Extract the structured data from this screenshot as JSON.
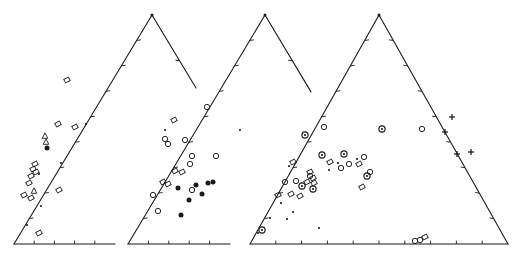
{
  "figure": {
    "background": "#ffffff",
    "line_color": "#1a1a1a",
    "marker_color": "#1a1a1a"
  },
  "panels": [
    {
      "id": "a",
      "label": "a)",
      "label_x": 104,
      "label_y": 24,
      "apex_label": "Na",
      "apex_label_x": 159,
      "apex_label_y": 18,
      "left_label": "Ca",
      "left_label_x": 9,
      "left_label_y": 259,
      "right_label": "",
      "geometry": {
        "apex": [
          152,
          15
        ],
        "left": [
          14,
          244
        ],
        "right": [
          290,
          244
        ],
        "clip_right_x": 196,
        "truncated": true
      },
      "ticks_left": 8,
      "ticks_right": 4,
      "ticks_bottom": 4
    },
    {
      "id": "b",
      "label": "b)",
      "label_x": 220,
      "label_y": 24,
      "apex_label": "Na",
      "apex_label_x": 272,
      "apex_label_y": 18,
      "left_label": "Ca",
      "left_label_x": 124,
      "left_label_y": 259,
      "right_label": "",
      "geometry": {
        "apex": [
          265,
          15
        ],
        "left": [
          128,
          244
        ],
        "right": [
          402,
          244
        ],
        "clip_right_x": 311,
        "truncated": true
      },
      "ticks_left": 8,
      "ticks_right": 4,
      "ticks_bottom": 4
    },
    {
      "id": "c",
      "label": "c)",
      "label_x": 337,
      "label_y": 24,
      "apex_label": "Na",
      "apex_label_x": 385,
      "apex_label_y": 18,
      "left_label": "Ca",
      "left_label_x": 247,
      "left_label_y": 259,
      "right_label": "K",
      "right_label_x": 502,
      "right_label_y": 259,
      "geometry": {
        "apex": [
          379,
          15
        ],
        "left": [
          250,
          244
        ],
        "right": [
          508,
          244
        ],
        "clip_right_x": 522,
        "truncated": false
      },
      "ticks_left": 8,
      "ticks_right": 8,
      "ticks_bottom": 9
    }
  ],
  "chart_data": {
    "type": "scatter",
    "xlabel": "Ca - K",
    "ylabel": "Na",
    "vertices": [
      "Ca",
      "Na",
      "K"
    ],
    "marker_legend": {
      "slanted-square": "open slanted square",
      "triangle": "open triangle",
      "filled-circle": "filled circle",
      "open-circle": "open circle",
      "bullseye": "circle with center dot",
      "plus": "plus sign",
      "dot": "small dot"
    },
    "series": [
      {
        "panel": "a",
        "name": "panel-a-points",
        "points": [
          {
            "x": 67,
            "y": 80,
            "m": "slanted-square"
          },
          {
            "x": 58,
            "y": 124,
            "m": "slanted-square"
          },
          {
            "x": 75,
            "y": 127,
            "m": "slanted-square"
          },
          {
            "x": 45,
            "y": 136,
            "m": "triangle"
          },
          {
            "x": 46,
            "y": 142,
            "m": "triangle"
          },
          {
            "x": 47,
            "y": 148,
            "m": "filled-circle"
          },
          {
            "x": 35,
            "y": 164,
            "m": "slanted-square"
          },
          {
            "x": 33,
            "y": 169,
            "m": "slanted-square"
          },
          {
            "x": 36,
            "y": 172,
            "m": "slanted-square"
          },
          {
            "x": 31,
            "y": 176,
            "m": "slanted-square"
          },
          {
            "x": 39,
            "y": 174,
            "m": "dot"
          },
          {
            "x": 29,
            "y": 183,
            "m": "slanted-square"
          },
          {
            "x": 34,
            "y": 191,
            "m": "triangle"
          },
          {
            "x": 24,
            "y": 195,
            "m": "slanted-square"
          },
          {
            "x": 31,
            "y": 198,
            "m": "slanted-square"
          },
          {
            "x": 59,
            "y": 190,
            "m": "slanted-square"
          },
          {
            "x": 86,
            "y": 124,
            "m": "dot"
          },
          {
            "x": 61,
            "y": 163,
            "m": "dot"
          },
          {
            "x": 41,
            "y": 206,
            "m": "dot"
          },
          {
            "x": 27,
            "y": 225,
            "m": "dot"
          },
          {
            "x": 39,
            "y": 233,
            "m": "slanted-square"
          },
          {
            "x": 165,
            "y": 130,
            "m": "dot"
          }
        ]
      },
      {
        "panel": "b",
        "name": "panel-b-points",
        "points": [
          {
            "x": 174,
            "y": 120,
            "m": "slanted-square"
          },
          {
            "x": 207,
            "y": 107,
            "m": "open-circle"
          },
          {
            "x": 165,
            "y": 139,
            "m": "open-circle"
          },
          {
            "x": 168,
            "y": 144,
            "m": "open-circle"
          },
          {
            "x": 185,
            "y": 140,
            "m": "open-circle"
          },
          {
            "x": 216,
            "y": 156,
            "m": "open-circle"
          },
          {
            "x": 192,
            "y": 156,
            "m": "open-circle"
          },
          {
            "x": 190,
            "y": 164,
            "m": "open-circle"
          },
          {
            "x": 175,
            "y": 171,
            "m": "slanted-square"
          },
          {
            "x": 182,
            "y": 172,
            "m": "slanted-square"
          },
          {
            "x": 163,
            "y": 182,
            "m": "slanted-square"
          },
          {
            "x": 168,
            "y": 184,
            "m": "slanted-square"
          },
          {
            "x": 178,
            "y": 188,
            "m": "filled-circle"
          },
          {
            "x": 196,
            "y": 185,
            "m": "filled-circle"
          },
          {
            "x": 208,
            "y": 183,
            "m": "filled-circle"
          },
          {
            "x": 213,
            "y": 182,
            "m": "filled-circle"
          },
          {
            "x": 192,
            "y": 190,
            "m": "open-circle"
          },
          {
            "x": 202,
            "y": 194,
            "m": "filled-circle"
          },
          {
            "x": 153,
            "y": 195,
            "m": "open-circle"
          },
          {
            "x": 158,
            "y": 211,
            "m": "open-circle"
          },
          {
            "x": 189,
            "y": 200,
            "m": "filled-circle"
          },
          {
            "x": 181,
            "y": 215,
            "m": "filled-circle"
          },
          {
            "x": 240,
            "y": 130,
            "m": "dot"
          }
        ]
      },
      {
        "panel": "c",
        "name": "panel-c-points",
        "points": [
          {
            "x": 382,
            "y": 129,
            "m": "bullseye"
          },
          {
            "x": 305,
            "y": 135,
            "m": "bullseye"
          },
          {
            "x": 324,
            "y": 127,
            "m": "open-circle"
          },
          {
            "x": 422,
            "y": 129,
            "m": "open-circle"
          },
          {
            "x": 445,
            "y": 132,
            "m": "plus"
          },
          {
            "x": 452,
            "y": 117,
            "m": "plus"
          },
          {
            "x": 471,
            "y": 152,
            "m": "plus"
          },
          {
            "x": 457,
            "y": 154,
            "m": "plus"
          },
          {
            "x": 322,
            "y": 155,
            "m": "bullseye"
          },
          {
            "x": 344,
            "y": 154,
            "m": "bullseye"
          },
          {
            "x": 364,
            "y": 157,
            "m": "open-circle"
          },
          {
            "x": 293,
            "y": 162,
            "m": "slanted-square"
          },
          {
            "x": 330,
            "y": 162,
            "m": "slanted-square"
          },
          {
            "x": 359,
            "y": 164,
            "m": "slanted-square"
          },
          {
            "x": 349,
            "y": 164,
            "m": "open-circle"
          },
          {
            "x": 357,
            "y": 159,
            "m": "dot"
          },
          {
            "x": 338,
            "y": 163,
            "m": "dot"
          },
          {
            "x": 329,
            "y": 170,
            "m": "dot"
          },
          {
            "x": 341,
            "y": 168,
            "m": "open-circle"
          },
          {
            "x": 310,
            "y": 176,
            "m": "open-circle"
          },
          {
            "x": 313,
            "y": 178,
            "m": "slanted-square"
          },
          {
            "x": 310,
            "y": 172,
            "m": "slanted-square"
          },
          {
            "x": 370,
            "y": 172,
            "m": "open-circle"
          },
          {
            "x": 367,
            "y": 176,
            "m": "bullseye"
          },
          {
            "x": 285,
            "y": 182,
            "m": "open-circle"
          },
          {
            "x": 296,
            "y": 181,
            "m": "open-circle"
          },
          {
            "x": 307,
            "y": 182,
            "m": "slanted-square"
          },
          {
            "x": 314,
            "y": 183,
            "m": "slanted-square"
          },
          {
            "x": 302,
            "y": 186,
            "m": "bullseye"
          },
          {
            "x": 313,
            "y": 189,
            "m": "bullseye"
          },
          {
            "x": 278,
            "y": 195,
            "m": "slanted-square"
          },
          {
            "x": 291,
            "y": 194,
            "m": "slanted-square"
          },
          {
            "x": 300,
            "y": 196,
            "m": "slanted-square"
          },
          {
            "x": 362,
            "y": 187,
            "m": "slanted-square"
          },
          {
            "x": 289,
            "y": 166,
            "m": "dot"
          },
          {
            "x": 281,
            "y": 203,
            "m": "dot"
          },
          {
            "x": 293,
            "y": 212,
            "m": "dot"
          },
          {
            "x": 270,
            "y": 218,
            "m": "dot"
          },
          {
            "x": 287,
            "y": 219,
            "m": "dot"
          },
          {
            "x": 262,
            "y": 230,
            "m": "bullseye"
          },
          {
            "x": 258,
            "y": 233,
            "m": "dot"
          },
          {
            "x": 319,
            "y": 228,
            "m": "dot"
          },
          {
            "x": 415,
            "y": 241,
            "m": "open-circle"
          },
          {
            "x": 420,
            "y": 240,
            "m": "open-circle"
          },
          {
            "x": 425,
            "y": 237,
            "m": "slanted-square"
          }
        ]
      }
    ]
  }
}
